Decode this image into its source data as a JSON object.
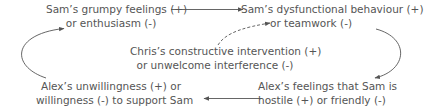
{
  "diagram": {
    "type": "causal-loop",
    "text_color": "#555555",
    "arrow_color": "#555555",
    "nodes": {
      "sam_feelings": {
        "line1": "Sam’s grumpy feelings (+)",
        "line2": "or enthusiasm (-)"
      },
      "sam_behaviour": {
        "line1": "Sam’s dysfunctional behaviour (+)",
        "line2": "or teamwork (-)"
      },
      "chris_intervention": {
        "line1": "Chris’s constructive intervention (+)",
        "line2": "or unwelcome interference (-)"
      },
      "alex_willingness": {
        "line1": "Alex’s unwillingness (+) or",
        "line2": "willingness (-) to support Sam"
      },
      "alex_feelings": {
        "line1": "Alex’s feelings that Sam is",
        "line2": "hostile (+) or friendly (-)"
      }
    },
    "edges": [
      {
        "from": "sam_feelings",
        "to": "sam_behaviour",
        "style": "solid"
      },
      {
        "from": "sam_behaviour",
        "to": "alex_feelings",
        "style": "solid"
      },
      {
        "from": "alex_feelings",
        "to": "alex_willingness",
        "style": "solid"
      },
      {
        "from": "alex_willingness",
        "to": "sam_feelings",
        "style": "solid"
      },
      {
        "from": "chris_intervention",
        "to": "sam_behaviour",
        "style": "dashed"
      }
    ]
  }
}
